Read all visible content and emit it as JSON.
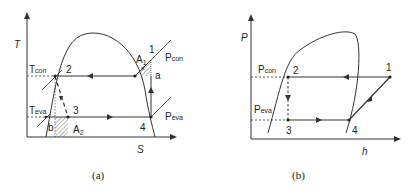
{
  "panel_a": {
    "caption": "(a)",
    "y_axis_label": "T",
    "x_axis_label": "S",
    "labels": {
      "t_con": "Tcon",
      "t_con_main": "T",
      "t_con_sub": "con",
      "t_eva_main": "T",
      "t_eva_sub": "eva",
      "p_con_main": "P",
      "p_con_sub": "con",
      "p_eva_main": "P",
      "p_eva_sub": "eva",
      "a1_main": "A",
      "a1_sub": "1",
      "a2_main": "A",
      "a2_sub": "2",
      "point_1": "1",
      "point_2": "2",
      "point_3": "3",
      "point_4": "4",
      "point_a": "a",
      "point_b": "b"
    }
  },
  "panel_b": {
    "caption": "(b)",
    "y_axis_label": "P",
    "x_axis_label": "h",
    "labels": {
      "p_con_main": "P",
      "p_con_sub": "con",
      "p_eva_main": "P",
      "p_eva_sub": "eva",
      "point_1": "1",
      "point_2": "2",
      "point_3": "3",
      "point_4": "4"
    }
  },
  "colors": {
    "line": "#333333",
    "hatch": "#555555"
  }
}
